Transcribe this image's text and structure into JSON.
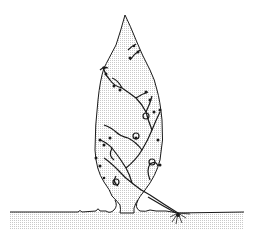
{
  "illustration": {
    "subject": "topiary-tree-with-climbing-vine",
    "colors": {
      "background": "#ffffff",
      "line": "#1a1a1a",
      "fill": "#e6e6e6",
      "ground": "#e8e8e8"
    }
  }
}
